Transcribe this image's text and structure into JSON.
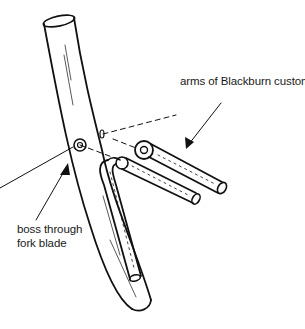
{
  "diagram": {
    "type": "technical-illustration",
    "labels": {
      "arms": "arms of Blackburn custom low-rider",
      "boss_line1": "boss through",
      "boss_line2": "fork blade"
    },
    "parts": [
      "fork-blade",
      "boss",
      "rack-arm-upper",
      "rack-arm-lower",
      "rack-strut",
      "mounting-eyelets"
    ],
    "colors": {
      "line": "#111111",
      "background": "#ffffff"
    }
  }
}
